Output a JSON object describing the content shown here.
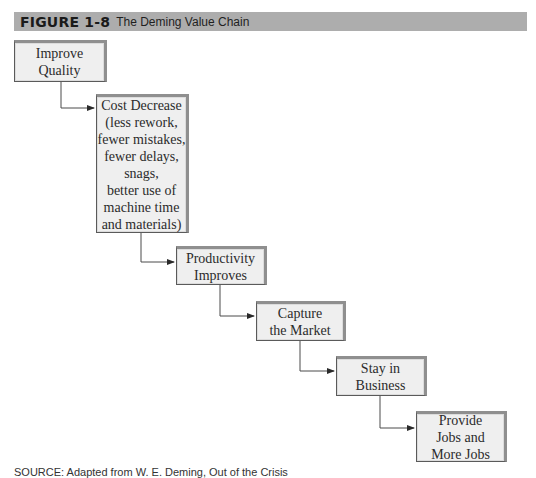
{
  "figure": {
    "label": "FIGURE 1-8",
    "title": "The Deming Value Chain",
    "header_color": "#adadad"
  },
  "chain": {
    "nodes": [
      {
        "id": "improve-quality",
        "text": "Improve\nQuality"
      },
      {
        "id": "cost-decrease",
        "text": "Cost Decrease\n(less rework,\nfewer mistakes,\nfewer delays,\nsnags,\nbetter use of\nmachine time\nand materials)"
      },
      {
        "id": "productivity-improves",
        "text": "Productivity\nImproves"
      },
      {
        "id": "capture-market",
        "text": "Capture\nthe Market"
      },
      {
        "id": "stay-in-business",
        "text": "Stay in\nBusiness"
      },
      {
        "id": "provide-jobs",
        "text": "Provide\nJobs and\nMore Jobs"
      }
    ],
    "edges": [
      {
        "from": "improve-quality",
        "to": "cost-decrease"
      },
      {
        "from": "cost-decrease",
        "to": "productivity-improves"
      },
      {
        "from": "productivity-improves",
        "to": "capture-market"
      },
      {
        "from": "capture-market",
        "to": "stay-in-business"
      },
      {
        "from": "stay-in-business",
        "to": "provide-jobs"
      }
    ]
  },
  "source": {
    "text": "SOURCE: Adapted from W. E. Deming, Out of the Crisis"
  }
}
